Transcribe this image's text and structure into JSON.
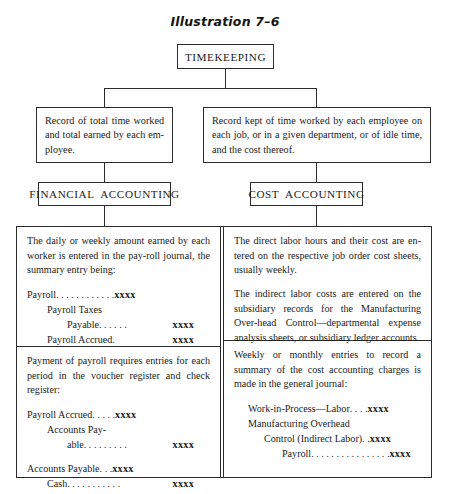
{
  "figure": {
    "title": "Illustration 7–6"
  },
  "nodes": {
    "root": "TIMEKEEPING",
    "left_record": "Record of total time worked and total earned by each em-ployee.",
    "right_record": "Record kept of time worked by each employee on each job, or in a given department, or of idle time, and the cost thereof.",
    "left_heading": "FINANCIAL  ACCOUNTING",
    "right_heading": "COST  ACCOUNTING"
  },
  "matrix": {
    "financial_top": {
      "paragraph": "The daily or weekly amount earned by each worker is entered in the pay-roll journal, the summary entry being:",
      "entry": [
        {
          "account": "Payroll",
          "leader": "…………",
          "debit": "xxxx",
          "credit": "",
          "indent": 0
        },
        {
          "account": "Payroll Taxes",
          "leader": "",
          "debit": "",
          "credit": "",
          "indent": 1
        },
        {
          "account": "Payable",
          "leader": "……",
          "debit": "",
          "credit": "xxxx",
          "indent": 2
        },
        {
          "account": "Payroll Accrued.",
          "leader": "",
          "debit": "",
          "credit": "xxxx",
          "indent": 1
        }
      ]
    },
    "financial_bottom": {
      "paragraph": "Payment of payroll requires entries for each period in the voucher register and check register:",
      "entry": [
        {
          "account": "Payroll Accrued",
          "leader": "……",
          "debit": "xxxx",
          "credit": "",
          "indent": 0
        },
        {
          "account": "Accounts Pay-",
          "leader": "",
          "debit": "",
          "credit": "",
          "indent": 1
        },
        {
          "account": "able",
          "leader": "………",
          "debit": "",
          "credit": "xxxx",
          "indent": 2
        }
      ],
      "entry2": [
        {
          "account": "Accounts Payable",
          "leader": "…",
          "debit": "xxxx",
          "credit": "",
          "indent": 0
        },
        {
          "account": "Cash",
          "leader": "………",
          "debit": "",
          "credit": "xxxx",
          "indent": 1
        }
      ]
    },
    "cost_top": {
      "paragraph1": "The direct labor hours and their cost are en-tered on the respective job order cost sheets, usually weekly.",
      "paragraph2": "The indirect labor costs are entered on the subsidiary records for the Manufacturing Over-head Control—departmental expense analysis sheets, or subsidiary ledger accounts"
    },
    "cost_bottom": {
      "paragraph": "Weekly or monthly entries to record a summary of the cost accounting charges is made in the general journal:",
      "entry": [
        {
          "account": "Work-in-Process—Labor",
          "leader": "……",
          "debit": "xxxx",
          "credit": "",
          "indent": 0
        },
        {
          "account": "Manufacturing Overhead",
          "leader": "",
          "debit": "",
          "credit": "",
          "indent": 0
        },
        {
          "account": "Control (Indirect Labor)",
          "leader": "…",
          "debit": "xxxx",
          "credit": "",
          "indent": 1
        },
        {
          "account": "Payroll",
          "leader": "………………",
          "debit": "",
          "credit": "xxxx",
          "indent": 2
        }
      ]
    }
  },
  "colors": {
    "line": "#2b2b2b",
    "text": "#1a1a1a",
    "background": "#ffffff"
  }
}
